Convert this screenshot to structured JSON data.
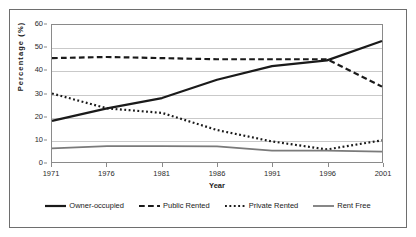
{
  "chart_data": {
    "type": "line",
    "title": "",
    "xlabel": "Year",
    "ylabel": "Percentage (%)",
    "categories": [
      "1971",
      "1976",
      "1981",
      "1986",
      "1991",
      "1996",
      "2001"
    ],
    "x": [
      1971,
      1976,
      1981,
      1986,
      1991,
      1996,
      2001
    ],
    "xlim": [
      1971,
      2001
    ],
    "ylim": [
      0,
      60
    ],
    "yticks": [
      0,
      10,
      20,
      30,
      40,
      50,
      60
    ],
    "ytick_labels": [
      "0",
      "10",
      "20",
      "30",
      "40",
      "50",
      "60"
    ],
    "grid": "horizontal",
    "legend_position": "bottom",
    "series": [
      {
        "name": "Owner-occupied",
        "style": "solid",
        "color": "#1a1a1a",
        "width": 2.2,
        "values": [
          18,
          23.5,
          28,
          36,
          42,
          44.5,
          53
        ]
      },
      {
        "name": "Public Rented",
        "style": "dashed",
        "color": "#1a1a1a",
        "width": 2.2,
        "values": [
          45.5,
          46,
          45.5,
          45,
          45,
          45,
          33
        ]
      },
      {
        "name": "Private Rented",
        "style": "dotted",
        "color": "#1a1a1a",
        "width": 2.2,
        "values": [
          30,
          23.5,
          21.5,
          14,
          9,
          5.5,
          9.5
        ]
      },
      {
        "name": "Rent Free",
        "style": "solid",
        "color": "#7a7a7a",
        "width": 1.8,
        "values": [
          6,
          7,
          7,
          6.8,
          5,
          5,
          4.5
        ]
      }
    ]
  },
  "axes": {
    "y_title": "Percentage (%)",
    "x_title": "Year"
  },
  "legend": {
    "items": [
      {
        "label": "Owner-occupied"
      },
      {
        "label": "Public Rented"
      },
      {
        "label": "Private Rented"
      },
      {
        "label": "Rent Free"
      }
    ]
  }
}
